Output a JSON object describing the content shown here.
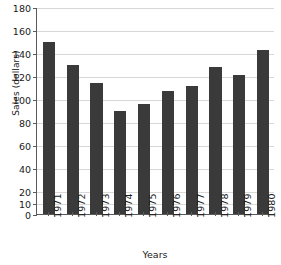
{
  "chart_data": {
    "type": "bar",
    "title": "",
    "xlabel": "Years",
    "ylabel": "Sales (dollars)",
    "categories": [
      "1971",
      "1972",
      "1973",
      "1974",
      "1975",
      "1976",
      "1977",
      "1978",
      "1979",
      "1980"
    ],
    "values": [
      150,
      130,
      114,
      90,
      96,
      107,
      111,
      128,
      121,
      143
    ],
    "series": [
      {
        "name": "Sales",
        "values": [
          150,
          130,
          114,
          90,
          96,
          107,
          111,
          128,
          121,
          143
        ],
        "color": "#3a3a3a"
      }
    ],
    "ylim": [
      0,
      180
    ],
    "yticks": [
      0,
      10,
      20,
      40,
      60,
      80,
      100,
      120,
      140,
      160,
      180
    ],
    "ytick_labels": [
      "0",
      "10",
      "20",
      "40",
      "60",
      "80",
      "100",
      "120",
      "140",
      "160",
      "180"
    ],
    "grid": true,
    "grid_axis": "y",
    "legend": false,
    "legend_position": "none",
    "bar_color": "#3a3a3a",
    "grid_color": "#d8d8d8",
    "axis_color": "#5a5a5a",
    "background_color": "#ffffff",
    "xtick_rotation": -90
  }
}
